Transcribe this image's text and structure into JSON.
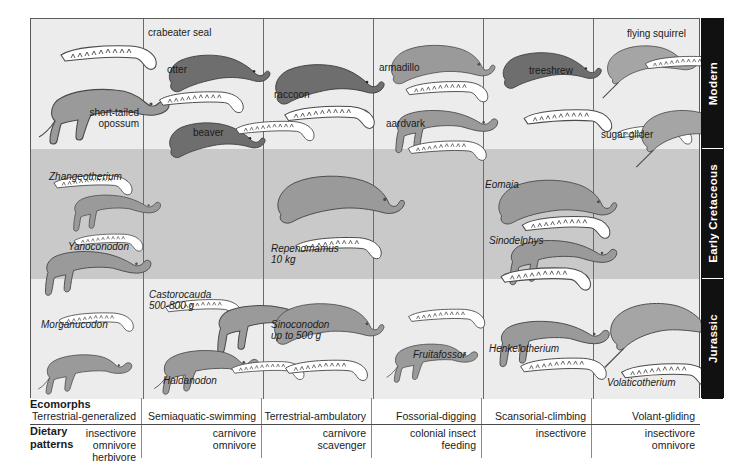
{
  "figure": {
    "periods": [
      {
        "id": "modern",
        "label": "Modern"
      },
      {
        "id": "cretaceous",
        "label": "Early Cretaceous"
      },
      {
        "id": "jurassic",
        "label": "Jurassic"
      }
    ],
    "columns": [
      {
        "index": 0,
        "ecomorph": "Terrestrial-generalized",
        "diet": "insectivore\nomnivore\nherbivore",
        "modern": [
          "short-tailed\nopossum"
        ],
        "cretaceous": [
          "Zhangeotherium",
          "Yanoconodon"
        ],
        "jurassic": [
          "Morganucodon"
        ]
      },
      {
        "index": 1,
        "ecomorph": "Semiaquatic-swimming",
        "diet": "carnivore\nomnivore",
        "modern": [
          "crabeater seal",
          "otter",
          "beaver"
        ],
        "cretaceous": [],
        "jurassic": [
          "Castorocauda\n500-800 g",
          "Haldanodon"
        ]
      },
      {
        "index": 2,
        "ecomorph": "Terrestrial-ambulatory",
        "diet": "carnivore\nscavenger",
        "modern": [
          "raccoon"
        ],
        "cretaceous": [
          "Repenomamus\n10 kg"
        ],
        "jurassic": [
          "Sinoconodon\nup to 500 g"
        ]
      },
      {
        "index": 3,
        "ecomorph": "Fossorial-digging",
        "diet": "colonial insect\nfeeding",
        "modern": [
          "armadillo",
          "aardvark"
        ],
        "cretaceous": [],
        "jurassic": [
          "Fruitafossor"
        ]
      },
      {
        "index": 4,
        "ecomorph": "Scansorial-climbing",
        "diet": "insectivore",
        "modern": [
          "treeshrew"
        ],
        "cretaceous": [
          "Eomaia",
          "Sinodelphys"
        ],
        "jurassic": [
          "Henkelotherium"
        ]
      },
      {
        "index": 5,
        "ecomorph": "Volant-gliding",
        "diet": "insectivore\nomnivore",
        "modern": [
          "flying squirrel",
          "sugar glider"
        ],
        "cretaceous": [],
        "jurassic": [
          "Volaticotherium"
        ]
      }
    ],
    "row_headers": {
      "ecomorphs": "Ecomorphs",
      "dietary": "Dietary\npatterns"
    },
    "colors": {
      "band_light": "#ececec",
      "band_dark": "#c9c9c9",
      "rail": "#111111",
      "rail_text": "#ffffff",
      "grid_line": "#6a6a6a",
      "body_fill_mid": "#9a9a9a",
      "body_fill_dark": "#6e6e6e",
      "jaw_fill": "#ffffff",
      "outline": "#4a4a4a"
    }
  }
}
